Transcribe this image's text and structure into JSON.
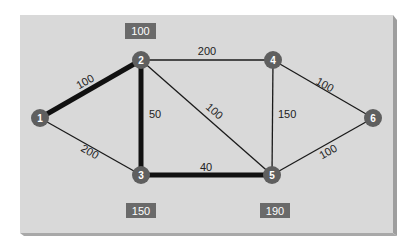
{
  "colors": {
    "background": "#ffffff",
    "panel": "#d9d9d9",
    "panel_shadow_right": "#9e9e9e",
    "panel_shadow_bottom": "#a8a8a8",
    "edge": "#1a1a1a",
    "edge_highlight": "#111111",
    "node": "#5f5f5f",
    "node_text": "#ffffff",
    "box": "#6a6a6a",
    "box_text": "#ffffff",
    "edge_label_text": "#222222"
  },
  "graph": {
    "nodes": [
      {
        "id": "1",
        "label": "1"
      },
      {
        "id": "2",
        "label": "2"
      },
      {
        "id": "3",
        "label": "3"
      },
      {
        "id": "4",
        "label": "4"
      },
      {
        "id": "5",
        "label": "5"
      },
      {
        "id": "6",
        "label": "6"
      }
    ],
    "edges": [
      {
        "from": "1",
        "to": "2",
        "weight": "100",
        "highlighted": true
      },
      {
        "from": "1",
        "to": "3",
        "weight": "200",
        "highlighted": false
      },
      {
        "from": "2",
        "to": "3",
        "weight": "50",
        "highlighted": true
      },
      {
        "from": "2",
        "to": "4",
        "weight": "200",
        "highlighted": false
      },
      {
        "from": "2",
        "to": "5",
        "weight": "100",
        "highlighted": false
      },
      {
        "from": "3",
        "to": "5",
        "weight": "40",
        "highlighted": true
      },
      {
        "from": "4",
        "to": "5",
        "weight": "150",
        "highlighted": false
      },
      {
        "from": "4",
        "to": "6",
        "weight": "100",
        "highlighted": false
      },
      {
        "from": "5",
        "to": "6",
        "weight": "100",
        "highlighted": false
      }
    ],
    "node_values": [
      {
        "node": "2",
        "value": "100"
      },
      {
        "node": "3",
        "value": "150"
      },
      {
        "node": "5",
        "value": "190"
      }
    ]
  }
}
